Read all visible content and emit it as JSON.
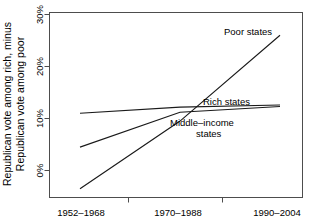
{
  "chart_data": {
    "type": "line",
    "title": "",
    "xlabel": "",
    "ylabel_line1": "Republican vote among rich, minus",
    "ylabel_line2": "Republican vote among poor",
    "categories": [
      "1952–1968",
      "1970–1988",
      "1990–2004"
    ],
    "x_tick_labels": [
      "1952–1968",
      "1970–1988",
      "1990–2004"
    ],
    "y_tick_labels": [
      "0%",
      "10%",
      "20%",
      "30%"
    ],
    "y_tick_values": [
      0,
      10,
      20,
      30
    ],
    "ylim": [
      -5,
      31
    ],
    "xlim": [
      0,
      2
    ],
    "grid": false,
    "legend_position": "inline-annotations",
    "series": [
      {
        "name": "Poor states",
        "label": "Poor states",
        "x": [
          0,
          1,
          2
        ],
        "values": [
          -3.5,
          9.5,
          26.0
        ]
      },
      {
        "name": "Rich states",
        "label": "Rich states",
        "x": [
          0,
          1,
          2
        ],
        "values": [
          11.0,
          12.2,
          12.6
        ]
      },
      {
        "name": "Middle-income states",
        "label_line1": "Middle–income",
        "label_line2": "states",
        "label": "Middle–income states",
        "x": [
          0,
          1,
          2
        ],
        "values": [
          4.5,
          11.2,
          12.3
        ]
      }
    ],
    "line_color": "#1a1a1a",
    "axis_color": "#4d4d4d",
    "background": "#ffffff"
  }
}
